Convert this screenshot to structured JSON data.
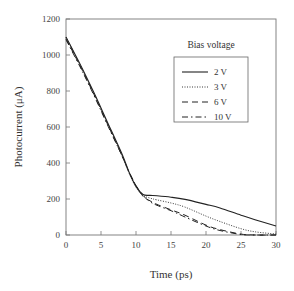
{
  "chart_data": {
    "type": "line",
    "title": "",
    "xlabel": "Time (ps)",
    "ylabel": "Photocurrent (μA)",
    "xlim": [
      0,
      30
    ],
    "ylim": [
      0,
      1200
    ],
    "xticks": [
      0,
      5,
      10,
      15,
      20,
      25,
      30
    ],
    "yticks": [
      0,
      200,
      400,
      600,
      800,
      1000,
      1200
    ],
    "grid": false,
    "legend": {
      "title": "Bias voltage",
      "position": "upper right",
      "entries": [
        "2 V",
        "3 V",
        "6 V",
        "10 V"
      ]
    },
    "x": [
      0,
      2,
      4,
      6,
      8,
      9,
      10,
      11,
      12,
      13,
      15,
      17,
      20,
      22,
      25,
      27,
      30
    ],
    "series": [
      {
        "name": "2 V",
        "style": "solid",
        "values": [
          1100,
          950,
          790,
          620,
          450,
          350,
          270,
          225,
          220,
          218,
          210,
          198,
          170,
          150,
          110,
          85,
          50
        ]
      },
      {
        "name": "3 V",
        "style": "dotted",
        "values": [
          1100,
          945,
          785,
          615,
          440,
          345,
          265,
          220,
          205,
          195,
          178,
          155,
          105,
          75,
          35,
          18,
          5
        ]
      },
      {
        "name": "6 V",
        "style": "dashed",
        "values": [
          1090,
          940,
          780,
          610,
          440,
          350,
          275,
          215,
          190,
          170,
          140,
          110,
          55,
          30,
          5,
          0,
          0
        ]
      },
      {
        "name": "10 V",
        "style": "dash-dot",
        "values": [
          1085,
          935,
          775,
          605,
          440,
          350,
          275,
          220,
          185,
          165,
          135,
          100,
          50,
          25,
          3,
          0,
          0
        ]
      }
    ]
  },
  "labels": {
    "x_axis_title": "Time (ps)",
    "y_axis_title": "Photocurrent (μA)",
    "legend_title": "Bias voltage",
    "legend_items": [
      "2 V",
      "3 V",
      "6 V",
      "10 V"
    ]
  }
}
